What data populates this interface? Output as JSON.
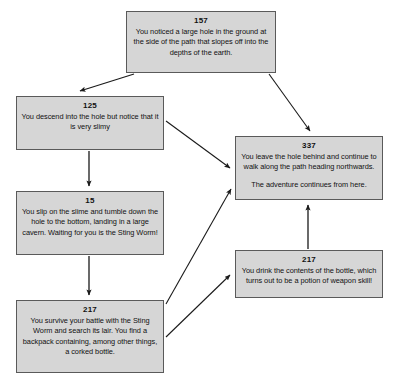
{
  "diagram": {
    "background_color": "#ffffff",
    "node_fill": "#d6d6d6",
    "node_border": "#5a5a5a",
    "arrow_color": "#1a1a1a",
    "nodes": [
      {
        "id": "157",
        "paragraphs": [
          "You noticed a large hole in the ground at the side of the path that slopes off into the depths of the earth."
        ]
      },
      {
        "id": "125",
        "paragraphs": [
          "You descend into the hole but notice that it is very slimy"
        ]
      },
      {
        "id": "15",
        "paragraphs": [
          "You slip on the slime and tumble down the hole to the bottom, landing in a large cavern. Waiting for you is the Sting Worm!"
        ]
      },
      {
        "id": "217",
        "paragraphs": [
          "You survive your battle with the Sting Worm and search its lair. You find a backpack containing, among other things, a corked bottle."
        ]
      },
      {
        "id": "337",
        "paragraphs": [
          "You leave the hole behind and continue to walk along the path heading northwards.",
          "The adventure continues from here."
        ]
      },
      {
        "id": "217",
        "paragraphs": [
          "You drink the contents of the bottle, which turns out to be a potion of weapon skill!"
        ]
      }
    ],
    "edges": [
      {
        "from": "157",
        "to": "125",
        "kind": "diagonal-down-left"
      },
      {
        "from": "157",
        "to": "337",
        "kind": "diagonal-down-right"
      },
      {
        "from": "125",
        "to": "15",
        "kind": "vertical-down"
      },
      {
        "from": "125",
        "to": "337",
        "kind": "diagonal-down-right"
      },
      {
        "from": "15",
        "to": "217",
        "kind": "vertical-down"
      },
      {
        "from": "217",
        "to": "337",
        "kind": "diagonal-up-right"
      },
      {
        "from": "217",
        "to": "217",
        "kind": "diagonal-up-right"
      },
      {
        "from": "217",
        "to": "337",
        "kind": "vertical-up"
      }
    ]
  }
}
